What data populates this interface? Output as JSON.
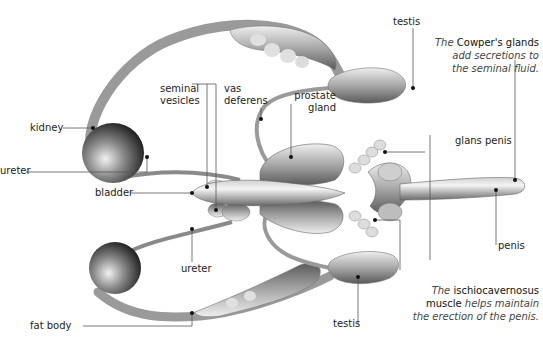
{
  "diagram": {
    "labels": {
      "testis_top": "testis",
      "testis_bottom": "testis",
      "kidney": "kidney",
      "ureter_left": "ureter",
      "ureter_bottom": "ureter",
      "bladder": "bladder",
      "seminal_vesicles_line1": "seminal",
      "seminal_vesicles_line2": "vesicles",
      "vas_deferens_line1": "vas",
      "vas_deferens_line2": "deferens",
      "prostate_line1": "prostate",
      "prostate_line2": "gland",
      "glans_penis": "glans penis",
      "penis": "penis",
      "fat_body": "fat body"
    },
    "captions": {
      "cowpers": {
        "prefix": "The",
        "term": "Cowper's glands",
        "line2": "add secretions to",
        "line3": "the seminal fluid."
      },
      "ischio": {
        "prefix": "The",
        "term": "ischiocavernosus",
        "line2_term": "muscle",
        "line2_rest": "helps maintain",
        "line3": "the erection of the penis."
      }
    },
    "colors": {
      "organ_light": "#e6e6e6",
      "organ_mid": "#a9a9a9",
      "organ_dark": "#4a4a4a",
      "leader_line": "#555555",
      "text": "#222222"
    }
  }
}
